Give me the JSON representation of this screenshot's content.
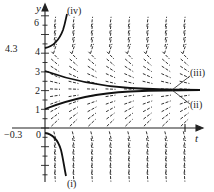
{
  "figure": {
    "type": "slope_field",
    "axes": {
      "x_label": "t",
      "y_label": "y",
      "y_tick_labels": [
        "6",
        "4",
        "3",
        "2",
        "1",
        "0"
      ],
      "extra_labels": {
        "upper_initial": "4.3",
        "lower_initial": "−0.3"
      }
    },
    "curves": [
      {
        "id": "i",
        "label": "(i)",
        "initial_value": -0.3,
        "behavior": "decreases to -infinity"
      },
      {
        "id": "ii",
        "label": "(ii)",
        "initial_value": 1,
        "behavior": "increases toward 2"
      },
      {
        "id": "iii",
        "label": "(iii)",
        "initial_value": 3,
        "behavior": "decreases toward 2"
      },
      {
        "id": "iv",
        "label": "(iv)",
        "initial_value": 4.3,
        "behavior": "increases to +infinity"
      }
    ],
    "equilibrium": 2,
    "colors": {
      "ink": "#222222",
      "background": "#ffffff"
    }
  }
}
